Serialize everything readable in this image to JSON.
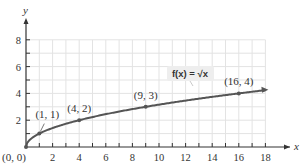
{
  "chart_data": {
    "type": "line",
    "title": "",
    "xlabel": "x",
    "ylabel": "y",
    "xlim": [
      0,
      18
    ],
    "ylim": [
      0,
      8
    ],
    "grid": true,
    "x_ticks": [
      2,
      4,
      6,
      8,
      10,
      12,
      14,
      16,
      18
    ],
    "y_ticks": [
      2,
      4,
      6,
      8
    ],
    "function_label": "f(x) = √x",
    "series": [
      {
        "name": "f(x) = √x",
        "x": [
          0,
          1,
          4,
          9,
          16
        ],
        "y": [
          0,
          1,
          2,
          3,
          4
        ]
      }
    ],
    "annotations": [
      {
        "text": "(0, 0)",
        "x": 0,
        "y": 0
      },
      {
        "text": "(1, 1)",
        "x": 1,
        "y": 1
      },
      {
        "text": "(4, 2)",
        "x": 4,
        "y": 2
      },
      {
        "text": "(9, 3)",
        "x": 9,
        "y": 3
      },
      {
        "text": "(16, 4)",
        "x": 16,
        "y": 4
      }
    ],
    "colors": {
      "curve": "#555555",
      "grid": "#e3e3e3",
      "axis": "#333333",
      "label_box": "#eeeeee"
    }
  }
}
